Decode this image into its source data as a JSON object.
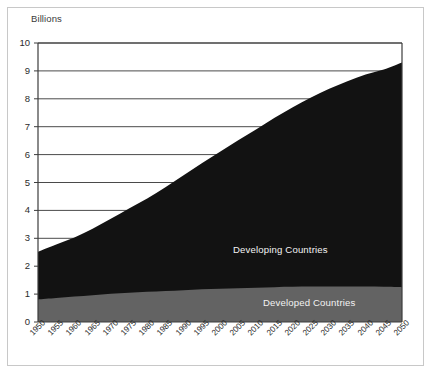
{
  "chart_data": {
    "type": "area",
    "stacked": true,
    "title": "",
    "subtitle": "",
    "units_label": "Billions",
    "xlabel": "",
    "ylabel": "Billions",
    "xlim": [
      1950,
      2050
    ],
    "ylim": [
      0,
      10
    ],
    "y_ticks": [
      0,
      1,
      2,
      3,
      4,
      5,
      6,
      7,
      8,
      9,
      10
    ],
    "y_tick_labels": [
      "0",
      "1",
      "2",
      "3",
      "4",
      "5",
      "6",
      "7",
      "8",
      "9",
      "10"
    ],
    "grid": "horizontal",
    "legend_position": "inline-on-area",
    "x": [
      1950,
      1955,
      1960,
      1965,
      1970,
      1975,
      1980,
      1985,
      1990,
      1995,
      2000,
      2005,
      2010,
      2015,
      2020,
      2025,
      2030,
      2035,
      2040,
      2045,
      2050
    ],
    "x_tick_labels": [
      "1950",
      "1955",
      "1960",
      "1965",
      "1970",
      "1975",
      "1980",
      "1985",
      "1990",
      "1995",
      "2000",
      "2005",
      "2010",
      "2015",
      "2020",
      "2025",
      "2030",
      "2035",
      "2040",
      "2045",
      "2050"
    ],
    "series": [
      {
        "name": "Developed Countries",
        "color": "#636363",
        "label_color": "#f2f2f2",
        "values": [
          0.81,
          0.86,
          0.91,
          0.96,
          1.01,
          1.05,
          1.08,
          1.11,
          1.14,
          1.17,
          1.19,
          1.21,
          1.23,
          1.25,
          1.26,
          1.27,
          1.27,
          1.27,
          1.27,
          1.26,
          1.25
        ]
      },
      {
        "name": "Developing Countries",
        "color": "#121212",
        "label_color": "#f2f2f2",
        "values": [
          1.71,
          1.92,
          2.12,
          2.38,
          2.69,
          3.02,
          3.35,
          3.72,
          4.12,
          4.52,
          4.91,
          5.3,
          5.68,
          6.07,
          6.44,
          6.78,
          7.09,
          7.36,
          7.6,
          7.79,
          8.05
        ]
      }
    ],
    "totals": [
      2.52,
      2.78,
      3.03,
      3.34,
      3.7,
      4.07,
      4.43,
      4.83,
      5.26,
      5.69,
      6.1,
      6.51,
      6.91,
      7.32,
      7.7,
      8.05,
      8.36,
      8.63,
      8.87,
      9.05,
      9.3
    ]
  },
  "labels": {
    "developing": "Developing Countries",
    "developed": "Developed Countries"
  },
  "colors": {
    "developing_area": "#121212",
    "developed_area": "#636363",
    "gridline": "#4a4a4a",
    "axis": "#3c3c3c",
    "frame": "#c8c8c8",
    "background": "#ffffff",
    "tick_text": "#2b2b2b"
  }
}
